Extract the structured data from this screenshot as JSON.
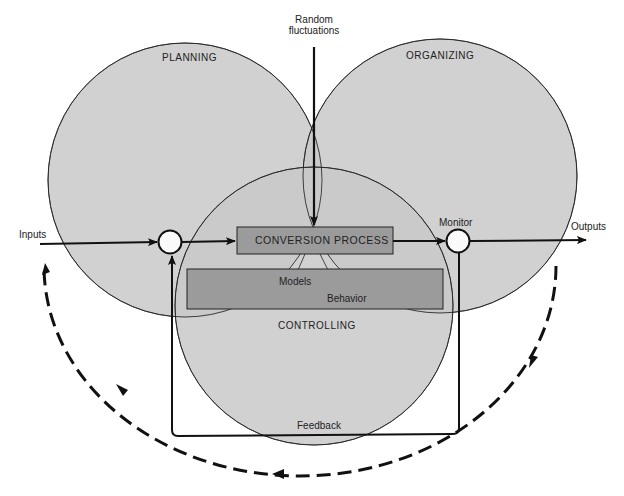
{
  "diagram": {
    "circles": [
      {
        "id": "planning",
        "label": "PLANNING"
      },
      {
        "id": "organizing",
        "label": "ORGANIZING"
      },
      {
        "id": "controlling",
        "label": "CONTROLLING"
      }
    ],
    "boxes": {
      "conversion": "CONVERSION PROCESS",
      "models_label": "Models",
      "behavior_label": "Behavior"
    },
    "labels": {
      "random_line1": "Random",
      "random_line2": "fluctuations",
      "inputs": "Inputs",
      "outputs": "Outputs",
      "monitor": "Monitor",
      "feedback": "Feedback"
    },
    "colors": {
      "circle_fill": "#c9c9c9",
      "box_fill": "#9b9b9b",
      "stroke": "#1a1a1a",
      "background": "#ffffff"
    }
  }
}
